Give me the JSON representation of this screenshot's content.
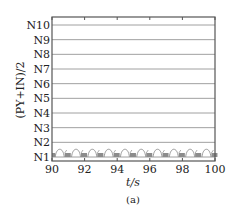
{
  "chart_data": {
    "type": "line",
    "title": "",
    "caption": "(a)",
    "xlabel": "t/s",
    "ylabel": "(PY+IN)/2",
    "xlim": [
      90,
      100
    ],
    "x_ticks": [
      90,
      92,
      94,
      96,
      98,
      100
    ],
    "y_ticks": [
      "N1",
      "N2",
      "N3",
      "N4",
      "N5",
      "N6",
      "N7",
      "N8",
      "N9",
      "N10"
    ],
    "ylim": [
      "N1",
      "N10"
    ],
    "grid": "horizontal",
    "legend": "none",
    "series": [
      {
        "name": "(PY+IN)/2 state",
        "description": "Periodic oscillation between N1 and about N1.5, period ~1 s, arch-shaped rises with gray filled plateau segments at base",
        "period_s": 1.0,
        "min_level": "N1",
        "max_level_approx": 1.5,
        "color": "#9a9a9a",
        "arches_x_start": [
          90.2,
          91.2,
          92.2,
          93.2,
          94.2,
          95.2,
          96.2,
          97.2,
          98.2,
          99.2
        ]
      }
    ],
    "colors": {
      "frame": "#555555",
      "grid": "#888888",
      "series": "#9a9a9a",
      "fill": "#8c8c8c"
    }
  }
}
